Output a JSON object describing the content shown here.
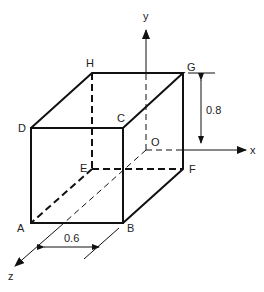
{
  "diagram": {
    "type": "3d-rectangular-box",
    "vertices": {
      "A": "A",
      "B": "B",
      "C": "C",
      "D": "D",
      "E": "E",
      "F": "F",
      "G": "G",
      "H": "H",
      "O": "O"
    },
    "axes": {
      "x": "x",
      "y": "y",
      "z": "z"
    },
    "dimensions": {
      "height": "0.8",
      "width": "0.6"
    },
    "colors": {
      "line": "#111111",
      "background": "#ffffff"
    }
  }
}
